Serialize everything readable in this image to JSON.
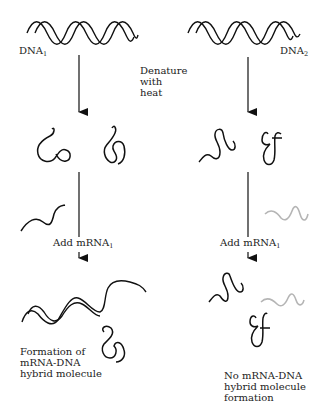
{
  "diagram": {
    "type": "flow-comparison",
    "colors": {
      "dna_strand": "#111111",
      "mrna_strand": "#b5b5b5",
      "text": "#222222",
      "background": "#ffffff"
    },
    "left_column": {
      "dna_label": "DNA",
      "dna_subscript": "1",
      "step_add_label": "Add mRNA",
      "step_add_subscript": "1",
      "mrna_color": "dark",
      "result_lines": [
        "Formation of",
        "mRNA-DNA",
        "hybrid molecule"
      ]
    },
    "right_column": {
      "dna_label": "DNA",
      "dna_subscript": "2",
      "step_add_label": "Add mRNA",
      "step_add_subscript": "1",
      "mrna_color": "light gray",
      "result_lines": [
        "No mRNA-DNA",
        "hybrid molecule",
        "formation"
      ]
    },
    "center_label_lines": [
      "Denature",
      "with",
      "heat"
    ]
  }
}
